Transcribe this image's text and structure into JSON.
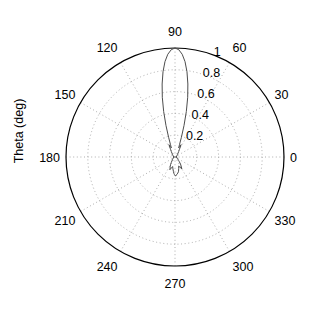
{
  "figure": {
    "type": "polar-plot",
    "y_axis_label": "Theta (deg)",
    "background_color": "#ffffff",
    "line_color": "#4d4d4d",
    "grid_color": "#999999",
    "axis_color": "#000000"
  },
  "angle_ticks": [
    {
      "label": "0",
      "deg": 0
    },
    {
      "label": "30",
      "deg": 30
    },
    {
      "label": "60",
      "deg": 60
    },
    {
      "label": "90",
      "deg": 90
    },
    {
      "label": "120",
      "deg": 120
    },
    {
      "label": "150",
      "deg": 150
    },
    {
      "label": "180",
      "deg": 180
    },
    {
      "label": "210",
      "deg": 210
    },
    {
      "label": "240",
      "deg": 240
    },
    {
      "label": "270",
      "deg": 270
    },
    {
      "label": "300",
      "deg": 300
    },
    {
      "label": "330",
      "deg": 330
    }
  ],
  "radial_ticks": [
    {
      "label": "0.2",
      "r": 0.2
    },
    {
      "label": "0.4",
      "r": 0.4
    },
    {
      "label": "0.6",
      "r": 0.6
    },
    {
      "label": "0.8",
      "r": 0.8
    },
    {
      "label": "1",
      "r": 1.0
    }
  ],
  "chart_data": {
    "type": "line",
    "title": "",
    "xlabel": "",
    "ylabel": "Theta (deg)",
    "polar": true,
    "theta_unit": "deg",
    "rlim": [
      0,
      1
    ],
    "rticks": [
      0.2,
      0.4,
      0.6,
      0.8,
      1
    ],
    "thetaticks": [
      0,
      30,
      60,
      90,
      120,
      150,
      180,
      210,
      240,
      270,
      300,
      330
    ],
    "grid": true,
    "legend": "none",
    "series": [
      {
        "name": "radiation pattern",
        "theta": [
          0,
          4,
          8,
          12,
          16,
          20,
          24,
          28,
          32,
          36,
          40,
          44,
          48,
          52,
          56,
          60,
          62,
          64,
          66,
          68,
          70,
          72,
          74,
          76,
          78,
          80,
          82,
          84,
          86,
          88,
          90,
          92,
          94,
          96,
          98,
          100,
          102,
          104,
          106,
          108,
          110,
          112,
          114,
          116,
          118,
          120,
          124,
          128,
          132,
          136,
          140,
          144,
          148,
          152,
          156,
          160,
          164,
          168,
          172,
          176,
          180,
          184,
          188,
          192,
          196,
          200,
          204,
          208,
          212,
          216,
          220,
          224,
          228,
          232,
          236,
          240,
          244,
          248,
          252,
          256,
          260,
          264,
          266,
          268,
          270,
          272,
          274,
          276,
          280,
          284,
          288,
          292,
          296,
          300,
          304,
          308,
          312,
          316,
          320,
          324,
          328,
          332,
          336,
          340,
          344,
          348,
          352,
          356,
          360
        ],
        "r": [
          0.012,
          0.01,
          0.014,
          0.016,
          0.012,
          0.018,
          0.02,
          0.016,
          0.022,
          0.026,
          0.024,
          0.03,
          0.036,
          0.046,
          0.06,
          0.082,
          0.1,
          0.126,
          0.105,
          0.09,
          0.12,
          0.19,
          0.3,
          0.43,
          0.56,
          0.68,
          0.79,
          0.88,
          0.945,
          0.985,
          1.0,
          0.985,
          0.945,
          0.88,
          0.79,
          0.68,
          0.56,
          0.43,
          0.3,
          0.19,
          0.12,
          0.09,
          0.105,
          0.126,
          0.1,
          0.082,
          0.06,
          0.046,
          0.036,
          0.03,
          0.024,
          0.026,
          0.022,
          0.016,
          0.02,
          0.018,
          0.012,
          0.016,
          0.014,
          0.01,
          0.012,
          0.01,
          0.014,
          0.016,
          0.012,
          0.018,
          0.02,
          0.016,
          0.022,
          0.026,
          0.024,
          0.03,
          0.036,
          0.046,
          0.06,
          0.082,
          0.1,
          0.126,
          0.105,
          0.09,
          0.11,
          0.135,
          0.15,
          0.16,
          0.17,
          0.172,
          0.17,
          0.16,
          0.15,
          0.135,
          0.11,
          0.09,
          0.105,
          0.126,
          0.1,
          0.082,
          0.06,
          0.046,
          0.036,
          0.03,
          0.024,
          0.026,
          0.022,
          0.016,
          0.02,
          0.018,
          0.012,
          0.01,
          0.012
        ]
      }
    ]
  },
  "geometry": {
    "center_x": 175,
    "center_y": 157,
    "radius": 109
  }
}
